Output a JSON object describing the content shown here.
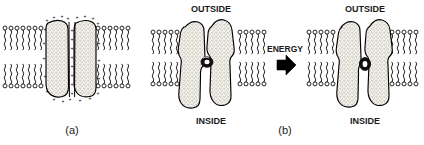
{
  "figure": {
    "type": "line-art-diagram",
    "background_color": "#ffffff",
    "ink_color": "#000000",
    "protein_fill": "#efece4"
  },
  "panels": [
    {
      "id": "a",
      "label": "(a)",
      "caption": "",
      "description": "Cross-section of a channel protein spanning the lipid bilayer, with positive charges lining the pore and protein surface",
      "charge_symbol": "+",
      "charge_count": 26,
      "subunit_count": 2,
      "state": "charged-channel"
    },
    {
      "id": "b",
      "label": "(b)",
      "caption": "",
      "description": "Conformational change of the channel from closed to open driven by energy input",
      "subunit_count": 2,
      "states": [
        "closed",
        "open"
      ],
      "membrane_labels": {
        "top": "OUTSIDE",
        "bottom": "INSIDE"
      },
      "transition": {
        "label": "ENERGY",
        "arrow": "right-arrow-solid",
        "direction": "right"
      }
    }
  ],
  "labels": {
    "outside_left": "OUTSIDE",
    "inside_left": "INSIDE",
    "outside_right": "OUTSIDE",
    "inside_right": "INSIDE",
    "energy": "ENERGY",
    "panel_a": "(a)",
    "panel_b": "(b)"
  },
  "membrane": {
    "leaflets": 2,
    "lipid_head_shape": "circle",
    "lipid_tail_shape": "wavy-line",
    "lipid_count_panel_a_left": 9,
    "lipid_count_panel_a_right": 9,
    "lipid_count_panel_b_closed_left": 6,
    "lipid_count_panel_b_closed_right": 6,
    "lipid_count_panel_b_open_left": 6,
    "lipid_count_panel_b_open_right": 6
  }
}
